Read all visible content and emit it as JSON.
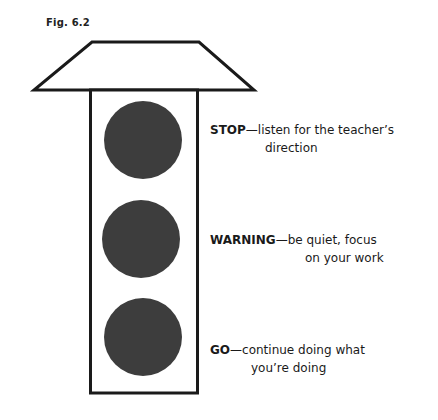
{
  "figure": {
    "label": "Fig. 6.2"
  },
  "colors": {
    "outline": "#1a1a1a",
    "light": "#3d3d3d",
    "background": "#ffffff"
  },
  "lights": [
    {
      "key": "STOP",
      "dash": "—",
      "text_line1": "listen for the teacher’s",
      "text_line2": "direction"
    },
    {
      "key": "WARNING",
      "dash": "—",
      "text_line1": "be quiet, focus",
      "text_line2": "on your work"
    },
    {
      "key": "GO",
      "dash": "—",
      "text_line1": "continue doing what",
      "text_line2": "you’re doing"
    }
  ]
}
